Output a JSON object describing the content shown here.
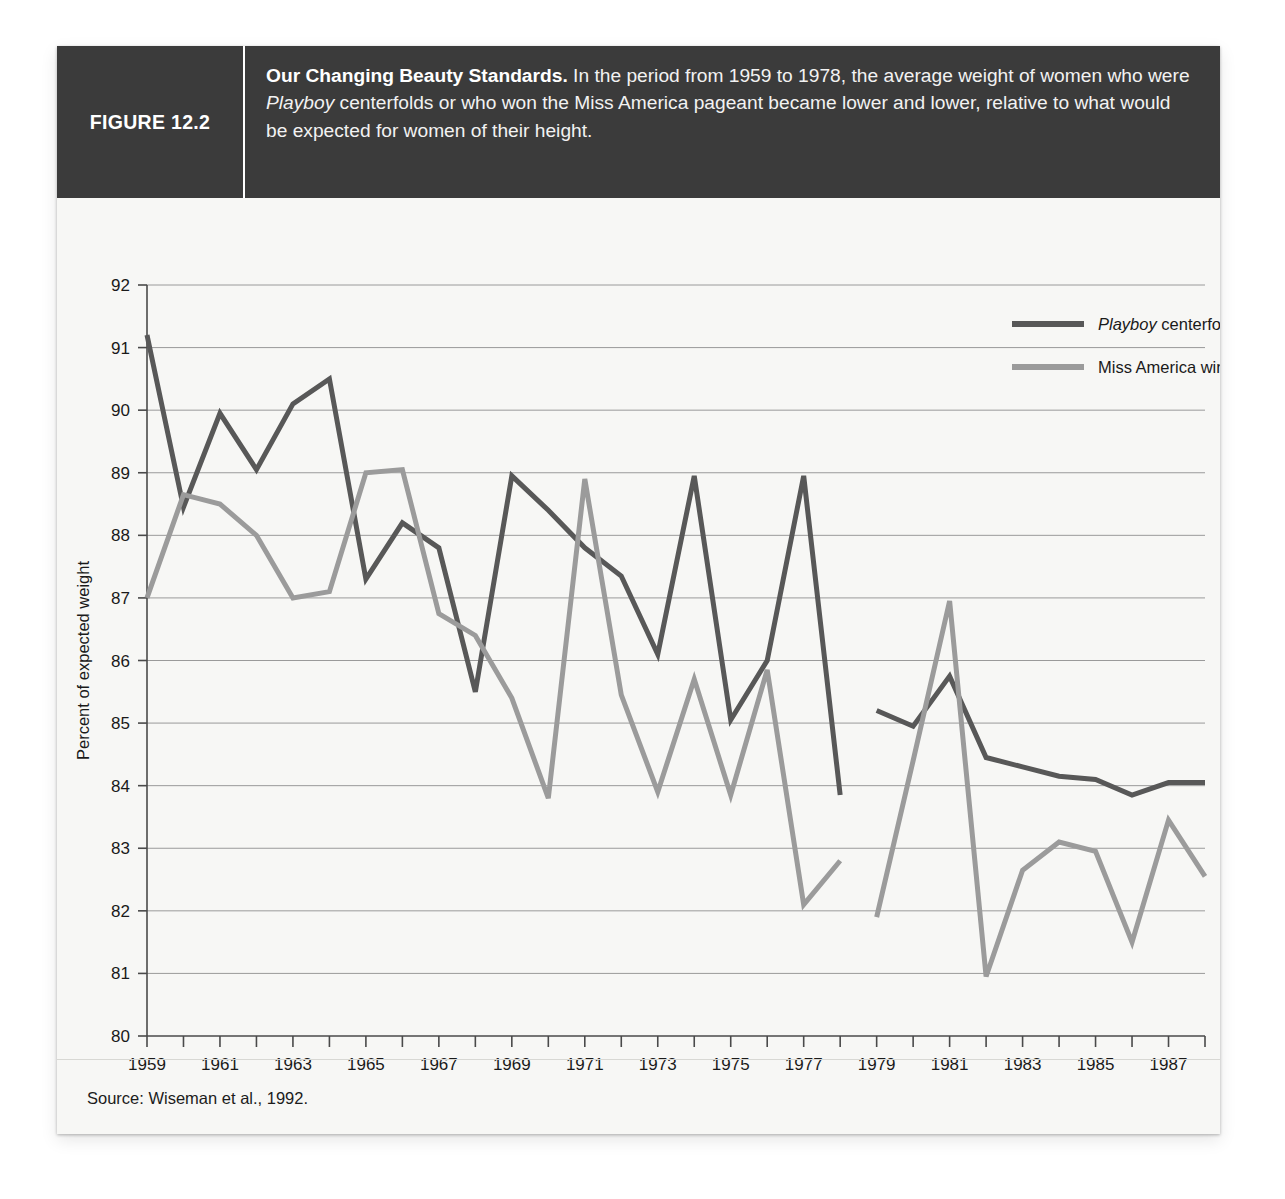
{
  "figure": {
    "label": "FIGURE 12.2",
    "caption_bold": "Our Changing Beauty Standards.",
    "caption_rest_1": " In the period from 1959 to 1978, the average weight of women who were ",
    "caption_italic": "Playboy",
    "caption_rest_2": " centerfolds or who won the Miss America pageant became lower and lower, relative to what would be expected for women of their height.",
    "source": "Source: Wiseman et al., 1992.",
    "header_bg": "#3b3b3b",
    "card_bg": "#f7f7f5"
  },
  "legend": {
    "items": [
      {
        "label_italic": "Playboy",
        "label_rest": " centerfolds",
        "color": "#585858"
      },
      {
        "label_italic": "",
        "label_rest": "Miss America winners",
        "color": "#9b9b9b"
      }
    ]
  },
  "chart_data": {
    "type": "line",
    "title": "Our Changing Beauty Standards",
    "xlabel": "",
    "ylabel": "Percent of expected weight",
    "ylim": [
      80,
      92
    ],
    "xlim": [
      1959,
      1988
    ],
    "grid": true,
    "legend_position": "top-right",
    "y_ticks": [
      80,
      81,
      82,
      83,
      84,
      85,
      86,
      87,
      88,
      89,
      90,
      91,
      92
    ],
    "x_ticks_all": [
      1959,
      1960,
      1961,
      1962,
      1963,
      1964,
      1965,
      1966,
      1967,
      1968,
      1969,
      1970,
      1971,
      1972,
      1973,
      1974,
      1975,
      1976,
      1977,
      1978,
      1979,
      1980,
      1981,
      1982,
      1983,
      1984,
      1985,
      1986,
      1987,
      1988
    ],
    "x_tick_labels": [
      1959,
      1961,
      1963,
      1965,
      1967,
      1969,
      1971,
      1973,
      1975,
      1977,
      1979,
      1981,
      1983,
      1985,
      1987
    ],
    "series": [
      {
        "name": "Playboy centerfolds",
        "color": "#585858",
        "segments": [
          {
            "x": [
              1959,
              1960,
              1961,
              1962,
              1963,
              1964,
              1965,
              1966,
              1967,
              1968,
              1969,
              1970,
              1971,
              1972,
              1973,
              1974,
              1975,
              1976,
              1977,
              1978
            ],
            "values": [
              91.2,
              88.45,
              89.95,
              89.05,
              90.1,
              90.5,
              87.3,
              88.2,
              87.8,
              85.5,
              88.95,
              88.4,
              87.8,
              87.35,
              86.1,
              88.95,
              85.05,
              86.0,
              88.95,
              83.85
            ]
          },
          {
            "x": [
              1979,
              1980,
              1981,
              1982,
              1983,
              1984,
              1985,
              1986,
              1987,
              1988
            ],
            "values": [
              85.2,
              84.95,
              85.75,
              84.45,
              84.3,
              84.15,
              84.1,
              83.85,
              84.05,
              84.05
            ]
          }
        ]
      },
      {
        "name": "Miss America winners",
        "color": "#9b9b9b",
        "segments": [
          {
            "x": [
              1959,
              1960,
              1961,
              1962,
              1963,
              1964,
              1965,
              1966,
              1967,
              1968,
              1969,
              1970,
              1971,
              1972,
              1973,
              1974,
              1975,
              1976,
              1977,
              1978
            ],
            "values": [
              87.0,
              88.65,
              88.5,
              88.0,
              87.0,
              87.1,
              89.0,
              89.05,
              86.75,
              86.4,
              85.4,
              83.8,
              88.9,
              85.45,
              83.9,
              85.7,
              83.85,
              85.85,
              82.1,
              82.8
            ]
          },
          {
            "x": [
              1979,
              1980,
              1981,
              1982,
              1983,
              1984,
              1985,
              1986,
              1987,
              1988
            ],
            "values": [
              81.9,
              84.4,
              86.95,
              80.95,
              82.65,
              83.1,
              82.95,
              81.5,
              83.45,
              82.55
            ]
          }
        ]
      }
    ]
  }
}
